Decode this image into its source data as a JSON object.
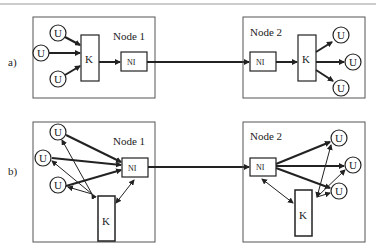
{
  "panels": [
    {
      "id": "a",
      "label": "a)",
      "node1": {
        "title": "Node 1",
        "ni": "NI",
        "k": "K",
        "users": [
          "U",
          "U",
          "U"
        ]
      },
      "node2": {
        "title": "Node 2",
        "ni": "NI",
        "k": "K",
        "users": [
          "U",
          "U",
          "U"
        ]
      }
    },
    {
      "id": "b",
      "label": "b)",
      "node1": {
        "title": "Node 1",
        "ni": "NI",
        "k": "K",
        "users": [
          "U",
          "U",
          "U"
        ]
      },
      "node2": {
        "title": "Node 2",
        "ni": "NI",
        "k": "K",
        "users": [
          "U",
          "U",
          "U"
        ]
      }
    }
  ],
  "colors": {
    "stroke": "#222222",
    "box": "#555555",
    "topline": "#999999"
  }
}
